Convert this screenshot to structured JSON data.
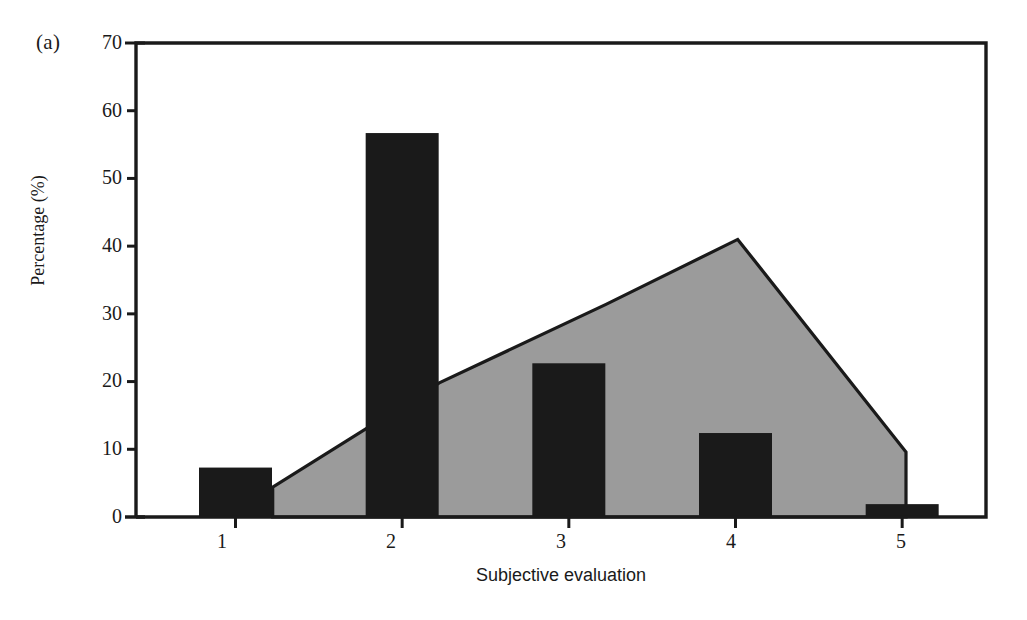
{
  "figure": {
    "panel_label": "(a)",
    "background_color": "#ffffff"
  },
  "chart_data": {
    "type": "bar",
    "title": "",
    "subtitle": "",
    "xlabel": "Subjective evaluation",
    "ylabel": "Percentage (%)",
    "categories": [
      "1",
      "2",
      "3",
      "4",
      "5"
    ],
    "xtick_labels": [
      "1",
      "2",
      "3",
      "4",
      "5"
    ],
    "ytick_labels": [
      "0",
      "10",
      "20",
      "30",
      "40",
      "50",
      "60",
      "70"
    ],
    "ylim": [
      0,
      70
    ],
    "ytick_step": 10,
    "xlim": [
      0.4,
      5.5
    ],
    "grid": false,
    "legend": null,
    "legend_position": "none",
    "series": [
      {
        "name": "bars",
        "type": "bar",
        "color": "#1a1a1a",
        "values": [
          7.3,
          56.7,
          22.7,
          12.4,
          1.9
        ]
      },
      {
        "name": "area",
        "type": "area",
        "color": "#9b9b9b",
        "edge_color": "#1a1a1a",
        "x": [
          1.22,
          2.22,
          3.22,
          4.01,
          5.02
        ],
        "values": [
          4.4,
          19.8,
          31.4,
          41.0,
          9.6
        ]
      }
    ]
  },
  "axes": {
    "y_ticks": [
      {
        "label": "70",
        "value": 70
      },
      {
        "label": "60",
        "value": 60
      },
      {
        "label": "50",
        "value": 50
      },
      {
        "label": "40",
        "value": 40
      },
      {
        "label": "30",
        "value": 30
      },
      {
        "label": "20",
        "value": 20
      },
      {
        "label": "10",
        "value": 10
      },
      {
        "label": "0",
        "value": 0
      }
    ],
    "x_ticks": [
      {
        "label": "1",
        "value": 1
      },
      {
        "label": "2",
        "value": 2
      },
      {
        "label": "3",
        "value": 3
      },
      {
        "label": "4",
        "value": 4
      },
      {
        "label": "5",
        "value": 5
      }
    ]
  },
  "colors": {
    "bar": "#1a1a1a",
    "area_fill": "#9b9b9b",
    "area_edge": "#1a1a1a",
    "axis": "#1a1a1a",
    "text": "#1a1a1a"
  }
}
